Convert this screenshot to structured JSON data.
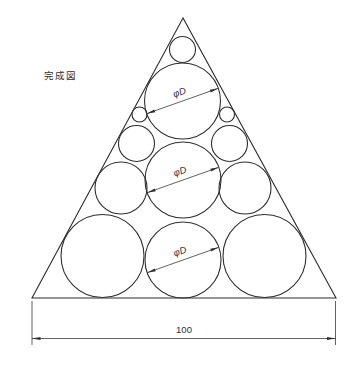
{
  "title_label": "完成図",
  "canvas": {
    "width": 357,
    "height": 371,
    "background": "#ffffff",
    "line_color": "#2e2e2e",
    "outline_stroke_width": 1.1,
    "dim_stroke_width": 0.75
  },
  "triangle": {
    "name": "triangle-outline",
    "points": "183,18 32,298 336,298"
  },
  "circles": [
    {
      "name": "circle-apex-small",
      "cx": 182.5,
      "cy": 49.5,
      "r": 13
    },
    {
      "name": "circle-top-large",
      "cx": 182.5,
      "cy": 101,
      "r": 38
    },
    {
      "name": "circle-left-tiny",
      "cx": 139.5,
      "cy": 114.5,
      "r": 7.5
    },
    {
      "name": "circle-right-tiny",
      "cx": 227,
      "cy": 114.5,
      "r": 7.5
    },
    {
      "name": "circle-left-small",
      "cx": 136.5,
      "cy": 143.5,
      "r": 18
    },
    {
      "name": "circle-right-small",
      "cx": 229.5,
      "cy": 143.5,
      "r": 18
    },
    {
      "name": "circle-left-medium",
      "cx": 121,
      "cy": 188,
      "r": 26
    },
    {
      "name": "circle-right-medium",
      "cx": 245,
      "cy": 188,
      "r": 26
    },
    {
      "name": "circle-middle-large",
      "cx": 183,
      "cy": 180,
      "r": 38
    },
    {
      "name": "circle-bottom-left",
      "cx": 102.5,
      "cy": 256,
      "r": 41.5
    },
    {
      "name": "circle-bottom-center",
      "cx": 183,
      "cy": 260,
      "r": 38
    },
    {
      "name": "circle-bottom-right",
      "cx": 264.5,
      "cy": 256,
      "r": 41.5
    }
  ],
  "diameter_dimensions": [
    {
      "label": "φD",
      "cx": 182.5,
      "cy": 101,
      "r": 38,
      "angle_deg": -19.5,
      "text_offset": 6
    },
    {
      "label": "φD",
      "cx": 183,
      "cy": 180,
      "r": 38,
      "angle_deg": -19.5,
      "text_offset": 6
    },
    {
      "label": "φD",
      "cx": 183,
      "cy": 260,
      "r": 38,
      "angle_deg": -19.5,
      "text_offset": 6
    }
  ],
  "base_dimension": {
    "label": "100",
    "x1": 32,
    "x2": 335.5,
    "line_y": 338.5,
    "ext_top": 301,
    "ext_bottom": 345,
    "text_x": 184,
    "text_y": 333
  }
}
